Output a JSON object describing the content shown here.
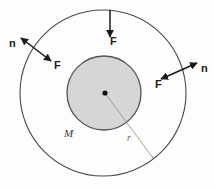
{
  "figure": {
    "background_color": "#fdfdfd",
    "outer_circle": {
      "name": "outer-circle",
      "cx": 103,
      "cy": 93,
      "r": 83,
      "stroke": "#4a4a4a",
      "fill": "none"
    },
    "inner_circle": {
      "name": "inner-shaded-circle",
      "cx": 104,
      "cy": 93,
      "r": 37,
      "stroke": "#555555",
      "fill": "#d6d6d6"
    },
    "center_dot": {
      "name": "center-point",
      "cx": 105,
      "cy": 93,
      "r": 2.6,
      "fill": "#111111"
    },
    "radius_line": {
      "name": "radius-line",
      "x1": 105,
      "y1": 93,
      "x2": 153,
      "y2": 158,
      "stroke": "#8c8c8c"
    },
    "labels": {
      "mass": "M",
      "radius": "r",
      "force_top": "F",
      "force_left": "F",
      "force_right": "F",
      "normal_left": "n",
      "normal_right": "n"
    },
    "arrows": {
      "top": {
        "name": "force-arrow-top",
        "x1": 110,
        "y1": 10,
        "x2": 110,
        "y2": 39,
        "stroke": "#1a1a1a",
        "label": "F"
      },
      "left": {
        "name": "normal-force-arrow-left",
        "x1": 19,
        "y1": 37,
        "x2": 53,
        "y2": 63,
        "stroke": "#1a1a1a",
        "label_tail": "n",
        "label_head": "F"
      },
      "right": {
        "name": "normal-force-arrow-right",
        "x1": 199,
        "y1": 62,
        "x2": 159,
        "y2": 80,
        "stroke": "#1a1a1a",
        "label_tail": "n",
        "label_head": "F"
      }
    }
  }
}
